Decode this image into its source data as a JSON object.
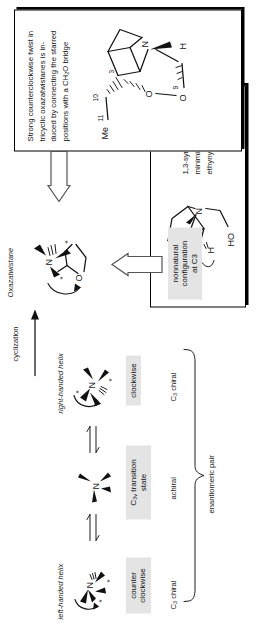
{
  "figure": {
    "orientation": "rotated-90"
  },
  "labels": {
    "oxazatwistane": "Oxazatwistane",
    "cyclization": "cyclization",
    "right_handed_helix": "right-handed helix",
    "left_handed_helix": "left-handed helix",
    "clockwise": "clockwise",
    "counter_clockwise": "counter clockwise",
    "c3v_transition_state_pre": "C",
    "c3v_transition_state_sub": "3v",
    "c3v_transition_state_post": " transition state",
    "nonnatural": "nonnatural\nconfiguration\nat C3",
    "nonnatural_l1": "nonnatural",
    "nonnatural_l2": "configuration",
    "nonnatural_l3": "at C3",
    "achiral": "achiral",
    "c3_chiral_top": "C3 chiral",
    "c3_chiral_bottom": "C3 chiral",
    "enantiomeric_pair": "enantiomeric pair"
  },
  "callout_top": {
    "text_l1": "Strong counterclockwise twist in",
    "text_l2": "tricyclic  oxazatwistanes  is  in-",
    "text_l3": "duced by connecting the starred",
    "text_l4": "positions with a CH2O bridge",
    "full_text": "Strong counterclockwise twist in tricyclic oxazatwistanes is induced by connecting the starred positions with a CH2O bridge",
    "structure_atoms": {
      "me": "Me",
      "me_sup": "11",
      "c10": "10",
      "c3": "3",
      "n": "N",
      "o_ring": "O",
      "o9": "O",
      "c9": "9",
      "h": "H"
    }
  },
  "callout_bottom": {
    "text_l1": "1,3-syn repulsion is",
    "text_l2": "minimized for",
    "text_l3": "ethynyl substituent",
    "full_text": "1,3-syn repulsion is minimized for ethynyl substituent",
    "structure_atoms": {
      "n": "N",
      "h": "H",
      "ho": "HO"
    }
  },
  "structures": {
    "oxazatwistane_atoms": {
      "n": "N",
      "o": "O",
      "star": "*"
    },
    "right_helix_atoms": {
      "n": "N",
      "star": "*"
    },
    "left_helix_atoms": {
      "n": "N",
      "star": "*"
    },
    "ts_atoms": {
      "n": "N"
    }
  },
  "colors": {
    "ink": "#111111",
    "gray_box": "#e4e4e4",
    "page": "#ffffff",
    "arrow_outline": "#555555"
  }
}
